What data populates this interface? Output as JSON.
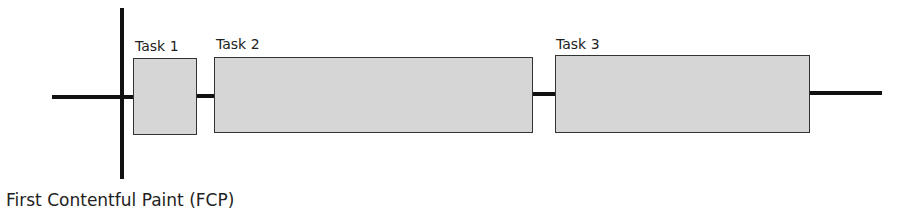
{
  "diagram": {
    "marker_label": "First Contentful Paint (FCP)",
    "tasks": [
      {
        "label": "Task 1"
      },
      {
        "label": "Task 2"
      },
      {
        "label": "Task 3"
      }
    ],
    "colors": {
      "task_fill": "#d6d6d6",
      "task_border": "#333333",
      "line": "#111111"
    }
  }
}
